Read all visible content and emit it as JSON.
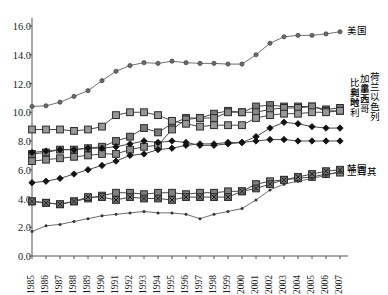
{
  "chart_data": {
    "type": "line",
    "title": "",
    "xlabel": "",
    "ylabel": "",
    "xlim": [
      1985,
      2007
    ],
    "ylim": [
      0.0,
      16.0
    ],
    "ytick_step": 2.0,
    "grid": false,
    "legend_position": "right",
    "x": [
      1985,
      1986,
      1987,
      1988,
      1989,
      1990,
      1991,
      1992,
      1993,
      1994,
      1995,
      1996,
      1997,
      1998,
      1999,
      2000,
      2001,
      2002,
      2003,
      2004,
      2005,
      2006,
      2007
    ],
    "yticks": [
      "0.0",
      "2.0",
      "4.0",
      "6.0",
      "8.0",
      "10.0",
      "12.0",
      "14.0",
      "16.0"
    ],
    "xticks": [
      "1985",
      "1986",
      "1987",
      "1988",
      "1989",
      "1990",
      "1991",
      "1992",
      "1993",
      "1994",
      "1995",
      "1996",
      "1997",
      "1998",
      "1999",
      "2000",
      "2001",
      "2002",
      "2003",
      "2004",
      "2005",
      "2006",
      "2007"
    ],
    "series": [
      {
        "name": "美国",
        "marker": "circle",
        "color": "#6b6b6b",
        "values": [
          10.4,
          10.45,
          10.7,
          11.1,
          11.5,
          12.2,
          12.85,
          13.25,
          13.45,
          13.4,
          13.55,
          13.45,
          13.4,
          13.4,
          13.35,
          13.35,
          14.0,
          14.8,
          15.25,
          15.35,
          15.35,
          15.45,
          15.6
        ]
      },
      {
        "name": "比利时",
        "marker": "square",
        "color": "#7a7a7a",
        "values": [
          7.1,
          7.2,
          7.4,
          7.4,
          7.5,
          7.6,
          8.0,
          8.3,
          8.9,
          8.6,
          9.2,
          9.6,
          9.6,
          9.9,
          10.1,
          10.0,
          10.4,
          10.5,
          10.4,
          10.4,
          10.4,
          10.2,
          10.3
        ]
      },
      {
        "name": "奥地利",
        "marker": "square",
        "color": "#8a8a8a",
        "values": [
          6.6,
          6.7,
          6.8,
          6.9,
          7.0,
          7.1,
          7.1,
          7.4,
          7.6,
          7.7,
          8.8,
          9.5,
          9.6,
          9.6,
          10.0,
          10.0,
          10.0,
          10.2,
          10.3,
          10.3,
          10.4,
          10.1,
          10.1
        ]
      },
      {
        "name": "加拿大",
        "marker": "square",
        "color": "#999999",
        "values": [
          8.8,
          8.8,
          8.8,
          8.7,
          8.8,
          9.0,
          9.8,
          10.0,
          10.0,
          9.8,
          9.4,
          9.2,
          9.0,
          9.1,
          9.1,
          9.1,
          9.6,
          9.8,
          9.9,
          9.9,
          10.0,
          10.0,
          10.1
        ]
      },
      {
        "name": "墨西哥",
        "marker": "square",
        "color": "#808080",
        "values": [
          3.8,
          3.7,
          3.6,
          3.8,
          4.0,
          4.2,
          4.4,
          4.4,
          4.3,
          4.4,
          4.4,
          4.3,
          4.4,
          4.4,
          4.5,
          4.5,
          5.0,
          5.2,
          5.3,
          5.4,
          5.5,
          5.7,
          5.8
        ]
      },
      {
        "name": "荷兰",
        "marker": "diamond",
        "color": "#2a2a2a",
        "values": [
          7.2,
          7.3,
          7.4,
          7.4,
          7.5,
          7.5,
          7.6,
          7.8,
          8.0,
          7.9,
          8.0,
          7.9,
          7.7,
          7.7,
          7.8,
          7.9,
          8.3,
          8.9,
          9.3,
          9.2,
          9.0,
          8.9,
          8.9
        ]
      },
      {
        "name": "以色列",
        "marker": "diamond",
        "color": "#1a1a1a",
        "values": [
          5.1,
          5.2,
          5.4,
          5.7,
          6.0,
          6.3,
          6.6,
          7.0,
          7.1,
          7.4,
          7.5,
          7.7,
          7.8,
          7.8,
          7.9,
          7.9,
          8.0,
          8.1,
          8.1,
          8.0,
          8.0,
          8.0,
          8.0
        ]
      },
      {
        "name": "韩国",
        "marker": "square-x",
        "color": "#6e6e6e",
        "values": [
          3.8,
          3.7,
          3.6,
          3.8,
          4.1,
          4.1,
          3.9,
          4.1,
          4.0,
          4.0,
          3.9,
          4.1,
          4.1,
          4.1,
          4.1,
          4.5,
          4.7,
          5.0,
          5.3,
          5.5,
          5.7,
          5.9,
          6.0
        ]
      },
      {
        "name": "土耳其",
        "marker": "dot",
        "color": "#5a5a5a",
        "values": [
          1.7,
          2.1,
          2.2,
          2.4,
          2.6,
          2.8,
          2.9,
          3.0,
          3.1,
          3.0,
          3.0,
          2.9,
          2.6,
          2.9,
          3.1,
          3.3,
          3.9,
          4.6,
          5.0,
          5.2,
          5.4,
          5.6,
          5.9
        ]
      }
    ]
  },
  "legend": {
    "top": {
      "label": "美国"
    },
    "stack": [
      {
        "label": "比利时"
      },
      {
        "label": "奥地利"
      },
      {
        "label": "加拿大"
      },
      {
        "label": "墨西哥"
      }
    ],
    "stack2": [
      {
        "label": "荷兰"
      },
      {
        "label": "以色列"
      }
    ],
    "bottom": [
      {
        "label": "韩国"
      },
      {
        "label": "土耳其"
      }
    ]
  },
  "title_text": "",
  "colors": {
    "axis": "#555555",
    "text": "#1a1a1a",
    "background": "#ffffff"
  }
}
